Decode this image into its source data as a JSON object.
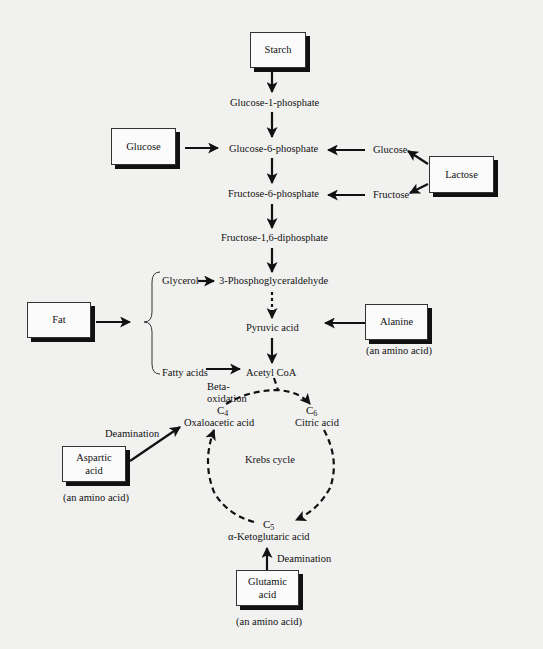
{
  "boxes": {
    "starch": "Starch",
    "glucose_left": "Glucose",
    "lactose": "Lactose",
    "fat": "Fat",
    "alanine": "Alanine",
    "aspartic_line1": "Aspartic",
    "aspartic_line2": "acid",
    "glutamic_line1": "Glutamic",
    "glutamic_line2": "acid"
  },
  "nodes": {
    "g1p": "Glucose-1-phosphate",
    "g6p": "Glucose-6-phosphate",
    "f6p": "Fructose-6-phosphate",
    "f16dp": "Fructose-1,6-diphosphate",
    "pgal": "3-Phosphoglyceraldehyde",
    "pyruvic": "Pyruvic acid",
    "acetyl": "Acetyl CoA",
    "glucose_right": "Glucose",
    "fructose_right": "Fructose",
    "glycerol": "Glycerol",
    "fatty_acids": "Fatty acids",
    "oxaloacetic": "Oxaloacetic acid",
    "citric": "Citric acid",
    "ketoglutaric": "α-Ketoglutaric acid",
    "krebs": "Krebs cycle"
  },
  "carbon_labels": {
    "c4": "C",
    "c4_sub": "4",
    "c6": "C",
    "c6_sub": "6",
    "c5": "C",
    "c5_sub": "5"
  },
  "annotations": {
    "beta1": "Beta-",
    "beta2": "oxidation",
    "deamination_aspartic": "Deamination",
    "deamination_glutamic": "Deamination",
    "amino_alanine": "(an amino acid)",
    "amino_aspartic": "(an amino acid)",
    "amino_glutamic": "(an amino acid)"
  },
  "colors": {
    "background": "#f1f1f0",
    "ink": "#111111",
    "box_fill": "#fbfbfb"
  }
}
